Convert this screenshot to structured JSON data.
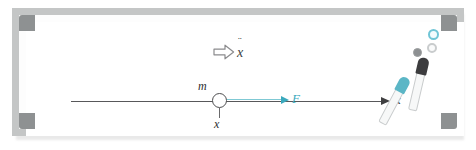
{
  "scene": {
    "title": "Whiteboard with Newton's second law free-body sketch",
    "background_color": "#ffffff"
  },
  "whiteboard": {
    "frame_color": "#c4c6c6",
    "corner_color": "#8e9192",
    "surface_color": "#ffffff",
    "corners": [
      {
        "name": "top-left"
      },
      {
        "name": "top-right"
      },
      {
        "name": "bottom-left"
      },
      {
        "name": "bottom-right"
      }
    ]
  },
  "diagram": {
    "axis": {
      "label": "x",
      "color": "#58585a",
      "direction": "right"
    },
    "mass": {
      "label": "m",
      "position_label": "x",
      "outline_color": "#4d4d4f"
    },
    "force": {
      "label": "F",
      "color": "#3aa9bd",
      "direction": "right"
    },
    "acceleration": {
      "arrow_icon": "hollow-block-arrow-right",
      "label": "x",
      "dots": "¨",
      "color": "#3b3b3d"
    }
  },
  "accessories": {
    "magnets": [
      {
        "name": "magnet-teal-ring",
        "color": "#6fc5d6",
        "style": "ring"
      },
      {
        "name": "magnet-gray-ring",
        "color": "#c9cccd",
        "style": "ring"
      },
      {
        "name": "magnet-gray-dot",
        "color": "#8d9092",
        "style": "solid"
      }
    ],
    "markers": [
      {
        "name": "marker-black",
        "cap_color": "#3c3c3e",
        "barrel_color": "#f7f8f8"
      },
      {
        "name": "marker-teal",
        "cap_color": "#5bb6c6",
        "barrel_color": "#f7f8f8"
      }
    ]
  }
}
